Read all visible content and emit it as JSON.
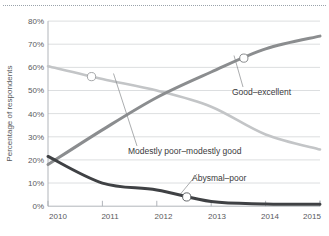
{
  "chart_data": {
    "type": "line",
    "title": "",
    "xlabel": "",
    "ylabel": "Percentage of respondents",
    "x": [
      "2010",
      "2011",
      "2012",
      "2013",
      "2014",
      "2015"
    ],
    "xlim": [
      2010,
      2015
    ],
    "ylim": [
      0,
      80
    ],
    "y_ticks": [
      "0%",
      "10%",
      "20%",
      "30%",
      "40%",
      "50%",
      "60%",
      "70%",
      "80%"
    ],
    "y_tick_values": [
      0,
      10,
      20,
      30,
      40,
      50,
      60,
      70,
      80
    ],
    "x_ticks": [
      "2010",
      "2011",
      "2012",
      "2013",
      "2014",
      "2015"
    ],
    "grid": "horizontal",
    "legend": "annotations-on-plot",
    "series": [
      {
        "name": "Good–excellent",
        "color": "#8b8d8f",
        "values": [
          18,
          33,
          47,
          58,
          68,
          73.5
        ],
        "marker_point": {
          "x": 2013.6,
          "y": 64
        }
      },
      {
        "name": "Modestly poor–modestly good",
        "color": "#c3c5c7",
        "values": [
          60.5,
          55,
          50,
          43,
          31,
          24.5
        ],
        "marker_point": {
          "x": 2010.8,
          "y": 56
        }
      },
      {
        "name": "Abysmal–poor",
        "color": "#3f4144",
        "values": [
          21.5,
          10,
          7,
          2,
          1,
          0.8
        ],
        "marker_point": {
          "x": 2012.55,
          "y": 4
        }
      }
    ],
    "annotations": [
      {
        "label": "Good–excellent",
        "text_x": 232,
        "text_y": 95
      },
      {
        "label": "Modestly poor–modestly good",
        "text_x": 128,
        "text_y": 154
      },
      {
        "label": "Abysmal–poor",
        "text_x": 192,
        "text_y": 181
      }
    ]
  },
  "axis": {
    "y_title": "Percentage of respondents",
    "y_labels": [
      "80%",
      "70%",
      "60%",
      "50%",
      "40%",
      "30%",
      "20%",
      "10%",
      "0%"
    ],
    "x_labels": [
      "2010",
      "2011",
      "2012",
      "2013",
      "2014",
      "2015"
    ]
  },
  "annotations": {
    "good_excellent": "Good–excellent",
    "modestly": "Modestly poor–modestly good",
    "abysmal": "Abysmal–poor"
  }
}
